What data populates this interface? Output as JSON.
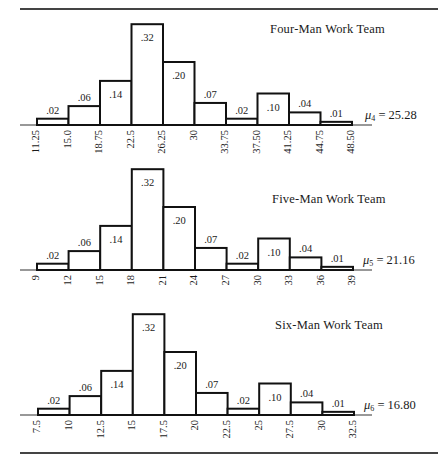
{
  "chart_data": [
    {
      "type": "bar",
      "title": "Four-Man Work Team",
      "mean_label": "μ",
      "mean_subscript": "4",
      "mean_value": "25.28",
      "bin_edges": [
        "11.25",
        "15.0",
        "18.75",
        "22.5",
        "26.25",
        "30",
        "33.75",
        "37.50",
        "41.25",
        "44.75",
        "48.50"
      ],
      "values": [
        0.02,
        0.06,
        0.14,
        0.32,
        0.2,
        0.07,
        0.02,
        0.1,
        0.04,
        0.01
      ],
      "value_labels": [
        ".02",
        ".06",
        ".14",
        ".32",
        ".20",
        ".07",
        ".02",
        ".10",
        ".04",
        ".01"
      ],
      "xlabel": "",
      "ylabel": "",
      "ylim": [
        0,
        0.32
      ],
      "grid": false
    },
    {
      "type": "bar",
      "title": "Five-Man Work Team",
      "mean_label": "μ",
      "mean_subscript": "5",
      "mean_value": "21.16",
      "bin_edges": [
        "9",
        "12",
        "15",
        "18",
        "21",
        "24",
        "27",
        "30",
        "33",
        "36",
        "39"
      ],
      "values": [
        0.02,
        0.06,
        0.14,
        0.32,
        0.2,
        0.07,
        0.02,
        0.1,
        0.04,
        0.01
      ],
      "value_labels": [
        ".02",
        ".06",
        ".14",
        ".32",
        ".20",
        ".07",
        ".02",
        ".10",
        ".04",
        ".01"
      ],
      "xlabel": "",
      "ylabel": "",
      "ylim": [
        0,
        0.32
      ],
      "grid": false
    },
    {
      "type": "bar",
      "title": "Six-Man Work Team",
      "mean_label": "μ",
      "mean_subscript": "6",
      "mean_value": "16.80",
      "bin_edges": [
        "7.5",
        "10",
        "12.5",
        "15",
        "17.5",
        "20",
        "22.5",
        "25",
        "27.5",
        "30",
        "32.5"
      ],
      "values": [
        0.02,
        0.06,
        0.14,
        0.32,
        0.2,
        0.07,
        0.02,
        0.1,
        0.04,
        0.01
      ],
      "value_labels": [
        ".02",
        ".06",
        ".14",
        ".32",
        ".20",
        ".07",
        ".02",
        ".10",
        ".04",
        ".01"
      ],
      "xlabel": "",
      "ylabel": "",
      "ylim": [
        0,
        0.32
      ],
      "grid": false
    }
  ],
  "panels": [
    {
      "title": "Four-Man Work Team",
      "mu_symbol": "μ",
      "mu_sub": "4",
      "mu_eq": " = 25.28"
    },
    {
      "title": "Five-Man Work Team",
      "mu_symbol": "μ",
      "mu_sub": "5",
      "mu_eq": " = 21.16"
    },
    {
      "title": "Six-Man Work Team",
      "mu_symbol": "μ",
      "mu_sub": "6",
      "mu_eq": " = 16.80"
    }
  ],
  "style": {
    "stroke": "#111111",
    "fill": "#ffffff",
    "axis": "#333333"
  }
}
